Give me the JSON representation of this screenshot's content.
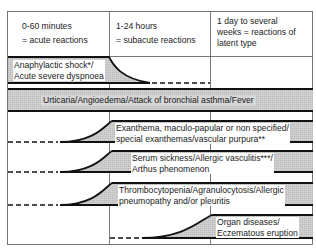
{
  "header": {
    "columns": [
      {
        "line1": "0-60 minutes",
        "line2": "= acute reactions"
      },
      {
        "line1": "1-24 hours",
        "line2": "= subacute reactions"
      },
      {
        "line1": "1 day to several",
        "line2": "weeks = reactions of",
        "line3": "latent type"
      }
    ]
  },
  "bands": [
    {
      "line1": "Anaphylactic shock*/",
      "line2": "Acute severe dyspnoea",
      "onset": "acute"
    },
    {
      "line1": "Urticaria/Angioedema/Attack of bronchial asthma/Fever",
      "onset": "all"
    },
    {
      "line1": "Exanthema, maculo-papular or non specified/",
      "line2": "special exanthemas/vascular purpura**",
      "onset": "subacute"
    },
    {
      "line1": "Serum sickness/Allergic vasculitis***/",
      "line2": "Arthus phenomenon",
      "onset": "subacute"
    },
    {
      "line1": "Thrombocytopenia/Agranulocytosis/Allergic",
      "line2": "pneumopathy and/or pleuritis",
      "onset": "subacute"
    },
    {
      "line1": "Organ diseases/",
      "line2": "Eczematous eruption",
      "onset": "latent"
    }
  ],
  "colors": {
    "band_fill": "#c8c8c8",
    "line": "#111111",
    "grid": "#444444"
  }
}
